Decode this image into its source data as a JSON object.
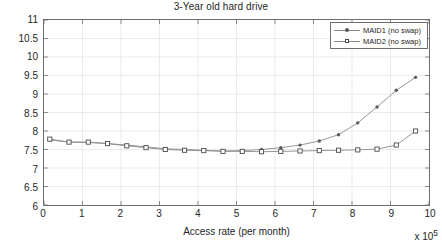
{
  "chart_data": {
    "type": "line",
    "title": "3-Year old hard drive",
    "xlabel": "Access rate (per month)",
    "ylabel": "AFR (%)",
    "x_multiplier": "x 10",
    "x_multiplier_exp": "5",
    "xlim": [
      0,
      10
    ],
    "ylim": [
      6,
      11
    ],
    "xticks": [
      0,
      1,
      2,
      3,
      4,
      5,
      6,
      7,
      8,
      9,
      10
    ],
    "xtick_labels": [
      "0",
      "1",
      "2",
      "3",
      "4",
      "5",
      "6",
      "7",
      "8",
      "9",
      "10"
    ],
    "yticks": [
      6,
      6.5,
      7,
      7.5,
      8,
      8.5,
      9,
      9.5,
      10,
      10.5,
      11
    ],
    "ytick_labels": [
      "6",
      "6.5",
      "7",
      "7.5",
      "8",
      "8.5",
      "9",
      "9.5",
      "10",
      "10.5",
      "11"
    ],
    "grid": true,
    "legend_position": "top-right",
    "x": [
      0.15,
      0.65,
      1.15,
      1.65,
      2.15,
      2.65,
      3.15,
      3.65,
      4.15,
      4.65,
      5.15,
      5.65,
      6.15,
      6.65,
      7.15,
      7.65,
      8.15,
      8.65,
      9.15,
      9.65
    ],
    "series": [
      {
        "name": "MAID1 (no swap)",
        "marker": "dot",
        "color": "#5a5a5a",
        "values": [
          7.76,
          7.7,
          7.69,
          7.66,
          7.62,
          7.57,
          7.52,
          7.5,
          7.48,
          7.46,
          7.47,
          7.5,
          7.55,
          7.62,
          7.73,
          7.9,
          8.22,
          8.65,
          9.1,
          9.45
        ]
      },
      {
        "name": "MAID2 (no swap)",
        "marker": "square",
        "color": "#4a4a4a",
        "values": [
          7.78,
          7.7,
          7.7,
          7.66,
          7.6,
          7.55,
          7.5,
          7.48,
          7.47,
          7.45,
          7.45,
          7.44,
          7.45,
          7.46,
          7.47,
          7.48,
          7.49,
          7.51,
          7.62,
          8.0
        ]
      }
    ]
  },
  "legend": {
    "entries": [
      {
        "label": "MAID1 (no swap)"
      },
      {
        "label": "MAID2 (no swap)"
      }
    ]
  }
}
